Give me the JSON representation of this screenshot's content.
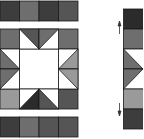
{
  "diagram": {
    "type": "quilt-block-assembly",
    "colors": {
      "black": "#2b2b2b",
      "dark": "#3d3d3d",
      "mid_dark": "#555555",
      "mid": "#6e6e6e",
      "light_gray": "#9a9a9a",
      "white": "#ffffff",
      "outline": "#1a1a1a"
    },
    "top_strip": {
      "cells": [
        "dark",
        "mid",
        "dark",
        "mid_dark"
      ]
    },
    "bottom_strip": {
      "cells": [
        "dark",
        "mid",
        "mid_dark",
        "mid_dark"
      ]
    },
    "center_block": {
      "rows": 4,
      "cols": 4,
      "center": "white"
    },
    "side_strip": {
      "cells": [
        "black",
        "mid",
        "star-point",
        "star-point",
        "light_gray",
        "dark"
      ],
      "arrows": [
        "up",
        "down"
      ]
    }
  }
}
